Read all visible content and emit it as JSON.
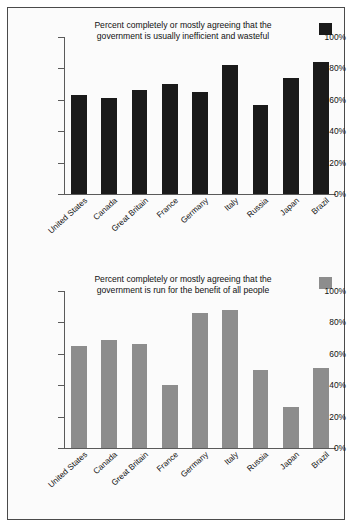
{
  "chart_data": [
    {
      "id": "top",
      "type": "bar",
      "title": "Percent completely or mostly agreeing that the government is usually inefficient and wasteful",
      "title_line1": "Percent completely or mostly agreeing that the",
      "title_line2": "government is usually inefficient and wasteful",
      "xlabel": "",
      "ylabel": "",
      "ylim": [
        0,
        100
      ],
      "grid": false,
      "legend_position": "top-right",
      "bar_color": "#1a1a1a",
      "categories": [
        "United States",
        "Canada",
        "Great Britain",
        "France",
        "Germany",
        "Italy",
        "Russia",
        "Japan",
        "Brazil"
      ],
      "values": [
        63,
        61,
        66,
        70,
        65,
        82,
        57,
        74,
        84
      ],
      "ticks": [
        "0%",
        "20%",
        "40%",
        "60%",
        "80%",
        "100%"
      ],
      "tick_values": [
        0,
        20,
        40,
        60,
        80,
        100
      ]
    },
    {
      "id": "bottom",
      "type": "bar",
      "title": "Percent completely or mostly agreeing that the government is run for the benefit of all people",
      "title_line1": "Percent completely or mostly agreeing that the",
      "title_line2": "government is run for the benefit of all people",
      "xlabel": "",
      "ylabel": "",
      "ylim": [
        0,
        100
      ],
      "grid": false,
      "legend_position": "top-right",
      "bar_color": "#8d8d8d",
      "categories": [
        "United States",
        "Canada",
        "Great Britain",
        "France",
        "Germany",
        "Italy",
        "Russia",
        "Japan",
        "Brazil"
      ],
      "values": [
        65,
        69,
        66,
        40,
        86,
        88,
        50,
        26,
        51
      ],
      "ticks": [
        "0%",
        "20%",
        "40%",
        "60%",
        "80%",
        "100%"
      ],
      "tick_values": [
        0,
        20,
        40,
        60,
        80,
        100
      ]
    }
  ],
  "colors": {
    "bar_dark": "#1a1a1a",
    "bar_gray": "#8d8d8d",
    "axis": "#5a5a5a",
    "text": "#111111",
    "frame": "#4a4a4a",
    "background": "#fbfbfb"
  }
}
